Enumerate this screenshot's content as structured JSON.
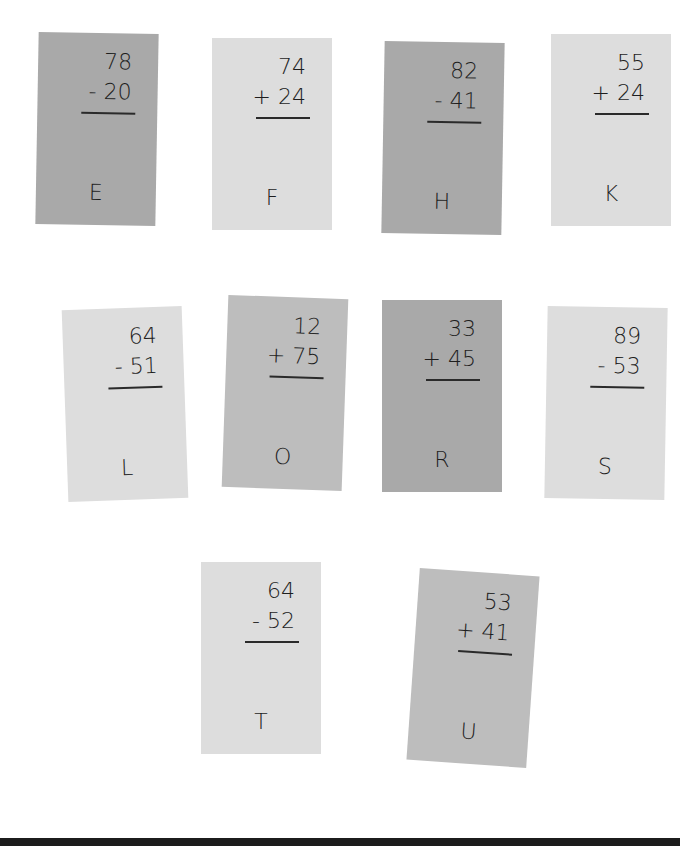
{
  "cards": [
    {
      "letter": "E",
      "top": "78",
      "op": "-",
      "bottom": "20",
      "shade": "dark"
    },
    {
      "letter": "F",
      "top": "74",
      "op": "+",
      "bottom": "24",
      "shade": "light"
    },
    {
      "letter": "H",
      "top": "82",
      "op": "-",
      "bottom": "41",
      "shade": "dark"
    },
    {
      "letter": "K",
      "top": "55",
      "op": "+",
      "bottom": "24",
      "shade": "light"
    },
    {
      "letter": "L",
      "top": "64",
      "op": "-",
      "bottom": "51",
      "shade": "light"
    },
    {
      "letter": "O",
      "top": "12",
      "op": "+",
      "bottom": "75",
      "shade": "mid"
    },
    {
      "letter": "R",
      "top": "33",
      "op": "+",
      "bottom": "45",
      "shade": "dark"
    },
    {
      "letter": "S",
      "top": "89",
      "op": "-",
      "bottom": "53",
      "shade": "light"
    },
    {
      "letter": "T",
      "top": "64",
      "op": "-",
      "bottom": "52",
      "shade": "light"
    },
    {
      "letter": "U",
      "top": "53",
      "op": "+",
      "bottom": "41",
      "shade": "mid"
    }
  ],
  "labels": {
    "c0": {
      "top": "78",
      "bottom": "- 20",
      "letter": "E"
    },
    "c1": {
      "top": "74",
      "bottom": "+ 24",
      "letter": "F"
    },
    "c2": {
      "top": "82",
      "bottom": "- 41",
      "letter": "H"
    },
    "c3": {
      "top": "55",
      "bottom": "+ 24",
      "letter": "K"
    },
    "c4": {
      "top": "64",
      "bottom": "- 51",
      "letter": "L"
    },
    "c5": {
      "top": "12",
      "bottom": "+ 75",
      "letter": "O"
    },
    "c6": {
      "top": "33",
      "bottom": "+ 45",
      "letter": "R"
    },
    "c7": {
      "top": "89",
      "bottom": "- 53",
      "letter": "S"
    },
    "c8": {
      "top": "64",
      "bottom": "- 52",
      "letter": "T"
    },
    "c9": {
      "top": "53",
      "bottom": "+ 41",
      "letter": "U"
    }
  },
  "colors": {
    "dark": "#a9a9a9",
    "mid": "#bdbdbd",
    "light": "#dddddd"
  }
}
